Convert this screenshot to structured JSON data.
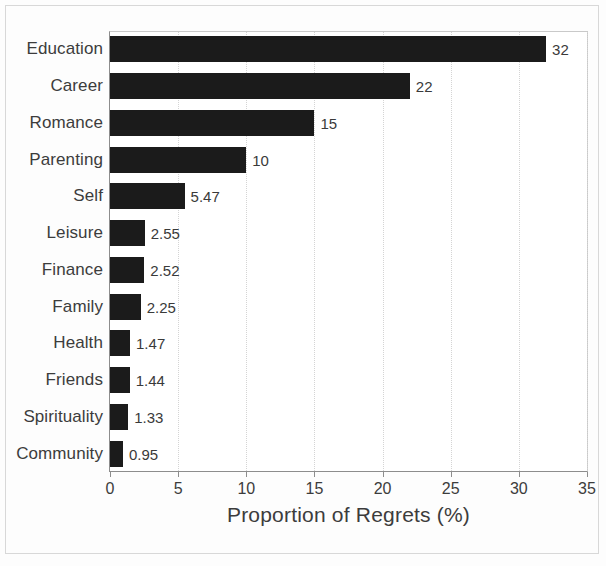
{
  "chart_data": {
    "type": "bar",
    "orientation": "horizontal",
    "title": "",
    "xlabel": "Proportion of Regrets (%)",
    "ylabel": "",
    "xlim": [
      0,
      35
    ],
    "xticks": [
      0,
      5,
      10,
      15,
      20,
      25,
      30,
      35
    ],
    "xtick_labels": [
      "0",
      "5",
      "10",
      "15",
      "20",
      "25",
      "30",
      "35"
    ],
    "grid": "vertical-dotted",
    "legend": null,
    "bar_color": "#1b1b1b",
    "categories": [
      "Education",
      "Career",
      "Romance",
      "Parenting",
      "Self",
      "Leisure",
      "Finance",
      "Family",
      "Health",
      "Friends",
      "Spirituality",
      "Community"
    ],
    "values": [
      32,
      22,
      15,
      10,
      5.47,
      2.55,
      2.52,
      2.25,
      1.47,
      1.44,
      1.33,
      0.95
    ],
    "value_labels": [
      "32",
      "22",
      "15",
      "10",
      "5.47",
      "2.55",
      "2.52",
      "2.25",
      "1.47",
      "1.44",
      "1.33",
      "0.95"
    ]
  }
}
